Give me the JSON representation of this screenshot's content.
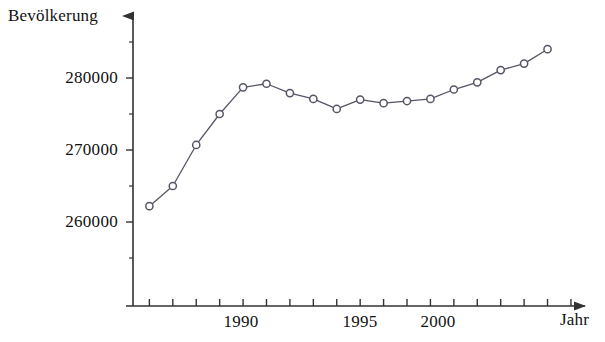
{
  "chart_data": {
    "type": "line",
    "title": "",
    "xlabel": "Jahr",
    "ylabel": "Bevölkerung",
    "xlim": [
      1986.3,
      2005.6
    ],
    "ylim": [
      252000,
      288500
    ],
    "grid": false,
    "legend": "none",
    "marker": "open-circle",
    "line_color": "#555566",
    "marker_color": "#555566",
    "axis_color": "#333333",
    "x": [
      1987,
      1988,
      1989,
      1990,
      1991,
      1992,
      1993,
      1994,
      1995,
      1996,
      1997,
      1998,
      1999,
      2000,
      2001,
      2002,
      2003,
      2004
    ],
    "values": [
      262200,
      265000,
      270700,
      275000,
      278700,
      279200,
      277900,
      277100,
      275700,
      277000,
      276500,
      276800,
      277100,
      278400,
      279400,
      281100,
      282000,
      284000
    ],
    "x_tick_values": [
      1987,
      1988,
      1989,
      1990,
      1991,
      1992,
      1993,
      1994,
      1995,
      1996,
      1997,
      1998,
      1999,
      2000,
      2001,
      2002,
      2003,
      2004,
      2005
    ],
    "x_tick_labels": [
      {
        "value": 1990,
        "label": "1990"
      },
      {
        "value": 1995,
        "label": "1995"
      },
      {
        "value": 2000,
        "label": "2000"
      }
    ],
    "y_ticks": [
      {
        "value": 260000,
        "label": "260000"
      },
      {
        "value": 270000,
        "label": "270000"
      },
      {
        "value": 280000,
        "label": "280000"
      }
    ],
    "y_minor_ticks": [
      255000,
      265000,
      275000,
      285000
    ]
  },
  "labels": {
    "y_axis_title": "Bevölkerung",
    "x_axis_title": "Jahr",
    "y_280000": "280000",
    "y_270000": "270000",
    "y_260000": "260000",
    "x_1990": "1990",
    "x_1995": "1995",
    "x_2000": "2000"
  }
}
